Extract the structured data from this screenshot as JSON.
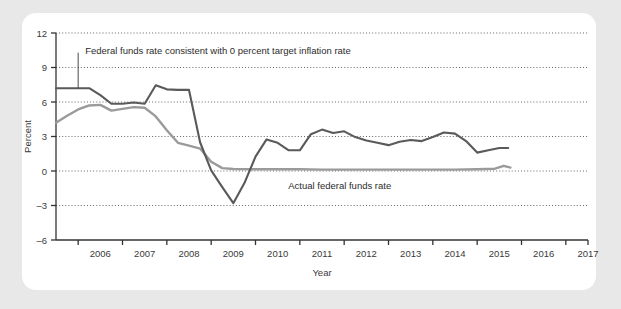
{
  "card": {
    "background_color": "#ffffff",
    "page_background_color": "#e8e8e8"
  },
  "chart_data": {
    "type": "line",
    "title": "",
    "xlabel": "Year",
    "ylabel": "Percent",
    "xlim": [
      2005.5,
      2017.5
    ],
    "ylim": [
      -6,
      12
    ],
    "yticks": [
      12,
      9,
      6,
      3,
      0,
      -3,
      -6
    ],
    "ytick_labels": [
      "12",
      "9",
      "6",
      "3",
      "0",
      "–3",
      "–6"
    ],
    "xticks": [
      2006,
      2007,
      2008,
      2009,
      2010,
      2011,
      2012,
      2013,
      2014,
      2015,
      2016,
      2017
    ],
    "xtick_labels": [
      "2006",
      "2007",
      "2008",
      "2009",
      "2010",
      "2011",
      "2012",
      "2013",
      "2014",
      "2015",
      "2016",
      "2017"
    ],
    "grid": "horizontal-dotted",
    "legend_position": "inline-annotations",
    "series": [
      {
        "name": "Federal funds rate consistent with 0 percent target inflation rate",
        "color": "#5a5a5a",
        "line_width": 2.1,
        "x": [
          2005.5,
          2005.75,
          2006.0,
          2006.25,
          2006.5,
          2006.75,
          2007.0,
          2007.25,
          2007.5,
          2007.75,
          2008.0,
          2008.25,
          2008.5,
          2008.75,
          2009.0,
          2009.25,
          2009.5,
          2009.75,
          2010.0,
          2010.25,
          2010.5,
          2010.75,
          2011.0,
          2011.25,
          2011.5,
          2011.75,
          2012.0,
          2012.25,
          2012.5,
          2012.75,
          2013.0,
          2013.25,
          2013.5,
          2013.75,
          2014.0,
          2014.25,
          2014.5,
          2014.75,
          2015.0,
          2015.25,
          2015.5,
          2015.7
        ],
        "y": [
          7.2,
          7.2,
          7.2,
          7.2,
          6.6,
          5.85,
          5.85,
          5.95,
          5.85,
          7.45,
          7.1,
          7.05,
          7.05,
          2.5,
          0.05,
          -1.4,
          -2.8,
          -1.05,
          1.25,
          2.75,
          2.45,
          1.8,
          1.8,
          3.2,
          3.6,
          3.3,
          3.45,
          2.95,
          2.65,
          2.45,
          2.25,
          2.55,
          2.7,
          2.6,
          2.95,
          3.35,
          3.25,
          2.6,
          1.6,
          1.8,
          2.0,
          2.0
        ]
      },
      {
        "name": "Actual federal funds rate",
        "color": "#9a9a9a",
        "line_width": 2.4,
        "x": [
          2005.5,
          2005.75,
          2006.0,
          2006.25,
          2006.5,
          2006.75,
          2007.0,
          2007.25,
          2007.5,
          2007.75,
          2008.0,
          2008.25,
          2008.5,
          2008.75,
          2009.0,
          2009.25,
          2009.5,
          2010.0,
          2010.5,
          2011.0,
          2011.5,
          2012.0,
          2012.5,
          2013.0,
          2013.5,
          2014.0,
          2014.5,
          2015.0,
          2015.4,
          2015.6,
          2015.75
        ],
        "y": [
          4.2,
          4.8,
          5.35,
          5.7,
          5.75,
          5.25,
          5.4,
          5.55,
          5.5,
          4.75,
          3.55,
          2.45,
          2.2,
          1.95,
          0.8,
          0.25,
          0.18,
          0.15,
          0.15,
          0.15,
          0.12,
          0.12,
          0.12,
          0.12,
          0.12,
          0.12,
          0.12,
          0.15,
          0.2,
          0.45,
          0.3
        ]
      }
    ],
    "annotations": [
      {
        "text": "Federal funds rate consistent with 0 percent target inflation rate",
        "x": 2006.0,
        "y": 10.2,
        "leader_to_x": 2006.0,
        "leader_to_y": 7.2
      },
      {
        "text": "Actual federal funds rate",
        "x": 2011.9,
        "y": -1.55
      }
    ]
  }
}
